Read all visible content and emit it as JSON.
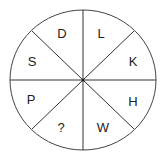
{
  "puzzle": {
    "type": "letter-wheel",
    "segments": [
      {
        "position": "top-left",
        "label": "D"
      },
      {
        "position": "top-right",
        "label": "L"
      },
      {
        "position": "right-upper",
        "label": "K"
      },
      {
        "position": "right-lower",
        "label": "H"
      },
      {
        "position": "bottom-right",
        "label": "W"
      },
      {
        "position": "bottom-left",
        "label": "?"
      },
      {
        "position": "left-lower",
        "label": "P"
      },
      {
        "position": "left-upper",
        "label": "S"
      }
    ]
  }
}
